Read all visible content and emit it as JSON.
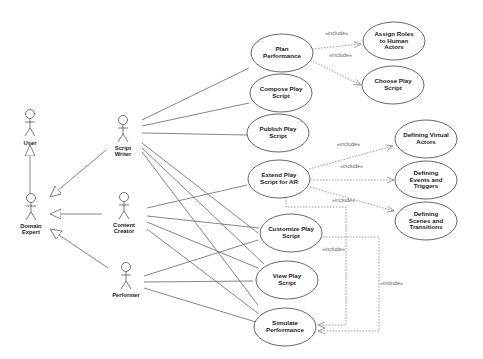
{
  "diagram": {
    "type": "UML Use Case Diagram",
    "include_label": "«include»",
    "actors": [
      {
        "id": "user",
        "label": "User"
      },
      {
        "id": "domain_expert",
        "label": "Domain\nExpert"
      },
      {
        "id": "script_writer",
        "label": "Script\nWriter"
      },
      {
        "id": "content_creator",
        "label": "Content\nCreator"
      },
      {
        "id": "performer",
        "label": "Performer"
      }
    ],
    "use_cases": [
      {
        "id": "plan_performance",
        "label": "Plan\nPerformance"
      },
      {
        "id": "compose_play_script",
        "label": "Compose Play\nScript"
      },
      {
        "id": "publish_play_script",
        "label": "Publish Play\nScript"
      },
      {
        "id": "extend_play_script_ar",
        "label": "Extend Play\nScript for AR"
      },
      {
        "id": "customize_play_script",
        "label": "Customize Play\nScript"
      },
      {
        "id": "view_play_script",
        "label": "View Play\nScript"
      },
      {
        "id": "simulate_performance",
        "label": "Simulate\nPerformance"
      },
      {
        "id": "assign_roles",
        "label": "Assign Roles\nto Human\nActors"
      },
      {
        "id": "choose_play_script",
        "label": "Choose Play\nScript"
      },
      {
        "id": "defining_virtual_actors",
        "label": "Defining Virtual\nActors"
      },
      {
        "id": "defining_events_triggers",
        "label": "Defining\nEvents and\nTriggers"
      },
      {
        "id": "defining_scenes_transitions",
        "label": "Defining\nScenes and\nTransitions"
      }
    ],
    "generalizations": [
      {
        "from": "Domain Expert",
        "to": "User"
      },
      {
        "from": "Script Writer",
        "to": "Domain Expert"
      },
      {
        "from": "Content Creator",
        "to": "Domain Expert"
      },
      {
        "from": "Performer",
        "to": "Domain Expert"
      }
    ],
    "includes": [
      {
        "from": "Plan Performance",
        "to": "Assign Roles to Human Actors"
      },
      {
        "from": "Plan Performance",
        "to": "Choose Play Script"
      },
      {
        "from": "Extend Play Script for AR",
        "to": "Defining Virtual Actors"
      },
      {
        "from": "Extend Play Script for AR",
        "to": "Defining Events and Triggers"
      },
      {
        "from": "Extend Play Script for AR",
        "to": "Defining Scenes and Transitions"
      },
      {
        "from": "Extend Play Script for AR",
        "to": "Simulate Performance"
      },
      {
        "from": "Customize Play Script",
        "to": "Simulate Performance"
      }
    ]
  }
}
